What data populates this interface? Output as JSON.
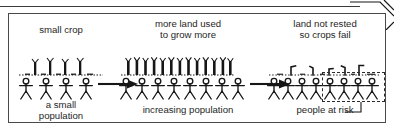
{
  "figure": {
    "frame_color": "#4a4a4a",
    "ink_color": "#161616"
  },
  "page": {
    "top_rule": true,
    "corner_fold_icon": "page-fold-corner"
  },
  "panels": [
    {
      "id": "panel-small-crop",
      "caption_top": "small crop",
      "caption_bottom_line1": "a small",
      "caption_bottom_line2": "population",
      "crop_count": 4,
      "crop_state": "healthy-sparse",
      "people_count": 4
    },
    {
      "id": "panel-more-land",
      "caption_top_line1": "more land used",
      "caption_top_line2": "to grow more",
      "caption_bottom_line1": "increasing population",
      "caption_bottom_line2": "",
      "crop_count": 13,
      "crop_state": "healthy-dense",
      "people_count": 8
    },
    {
      "id": "panel-crops-fail",
      "caption_top_line1": "land not rested",
      "caption_top_line2": "so crops fail",
      "caption_bottom_line1": "people at risk",
      "caption_bottom_line2": "",
      "crop_count": 5,
      "crop_state": "withered-broken",
      "people_count": 8,
      "people_at_risk": 4
    }
  ],
  "arrows": [
    {
      "id": "arrow-1",
      "direction": "right"
    },
    {
      "id": "arrow-2",
      "direction": "right"
    }
  ],
  "annotation": {
    "label": "people at risk",
    "highlight_style": "dashed-rectangle",
    "leader_line": true
  }
}
